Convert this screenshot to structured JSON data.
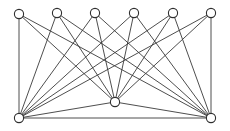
{
  "figure": {
    "background_color": "#ffffff",
    "width": 230,
    "height": 131
  },
  "graph_data": {
    "type": "graph",
    "graph_family": "complete bipartite",
    "notation": "K(3,6)",
    "node_count": 9,
    "edge_count": 21,
    "node_style": {
      "shape": "circle",
      "radius": 4.6,
      "fill_color": "#ffffff",
      "stroke_color": "#2e2e2e",
      "stroke_width": 1.1
    },
    "edge_style": {
      "stroke_color": "#3a3a3a",
      "stroke_width": 0.9
    },
    "partitions": [
      {
        "name": "top-row",
        "size": 6,
        "node_ids": [
          "t1",
          "t2",
          "t3",
          "t4",
          "t5",
          "t6"
        ]
      },
      {
        "name": "bottom-row",
        "size": 3,
        "node_ids": [
          "b1",
          "b2",
          "b3"
        ]
      }
    ],
    "nodes": [
      {
        "id": "t1",
        "label": "",
        "x": 19,
        "y": 14,
        "partition": "top-row",
        "degree": 3
      },
      {
        "id": "t2",
        "label": "",
        "x": 57,
        "y": 13,
        "partition": "top-row",
        "degree": 3
      },
      {
        "id": "t3",
        "label": "",
        "x": 95,
        "y": 13,
        "partition": "top-row",
        "degree": 3
      },
      {
        "id": "t4",
        "label": "",
        "x": 134,
        "y": 13,
        "partition": "top-row",
        "degree": 3
      },
      {
        "id": "t5",
        "label": "",
        "x": 173,
        "y": 13,
        "partition": "top-row",
        "degree": 3
      },
      {
        "id": "t6",
        "label": "",
        "x": 211,
        "y": 13,
        "partition": "top-row",
        "degree": 3
      },
      {
        "id": "b1",
        "label": "",
        "x": 19,
        "y": 118,
        "partition": "bottom-row",
        "degree": 7
      },
      {
        "id": "b2",
        "label": "",
        "x": 115,
        "y": 102,
        "partition": "bottom-row",
        "degree": 8
      },
      {
        "id": "b3",
        "label": "",
        "x": 211,
        "y": 118,
        "partition": "bottom-row",
        "degree": 7
      }
    ],
    "edges": [
      {
        "source": "t1",
        "target": "b1"
      },
      {
        "source": "t1",
        "target": "b2"
      },
      {
        "source": "t1",
        "target": "b3"
      },
      {
        "source": "t2",
        "target": "b1"
      },
      {
        "source": "t2",
        "target": "b2"
      },
      {
        "source": "t2",
        "target": "b3"
      },
      {
        "source": "t3",
        "target": "b1"
      },
      {
        "source": "t3",
        "target": "b2"
      },
      {
        "source": "t3",
        "target": "b3"
      },
      {
        "source": "t4",
        "target": "b1"
      },
      {
        "source": "t4",
        "target": "b2"
      },
      {
        "source": "t4",
        "target": "b3"
      },
      {
        "source": "t5",
        "target": "b1"
      },
      {
        "source": "t5",
        "target": "b2"
      },
      {
        "source": "t5",
        "target": "b3"
      },
      {
        "source": "t6",
        "target": "b1"
      },
      {
        "source": "t6",
        "target": "b2"
      },
      {
        "source": "t6",
        "target": "b3"
      },
      {
        "source": "b1",
        "target": "b2"
      },
      {
        "source": "b2",
        "target": "b3"
      },
      {
        "source": "b1",
        "target": "b3"
      }
    ]
  }
}
